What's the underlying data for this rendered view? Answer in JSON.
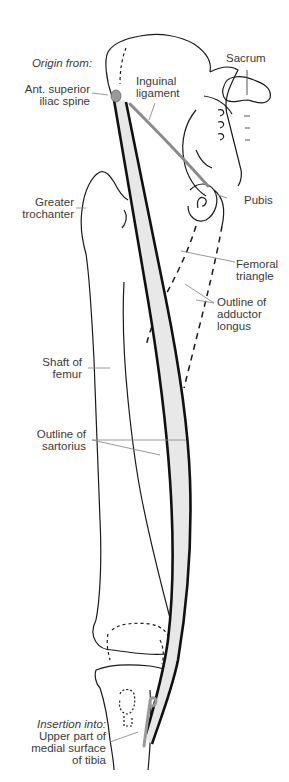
{
  "diagram": {
    "colors": {
      "muscle_fill": "#e8e8e8",
      "outline": "#1a1a1a",
      "ligament": "#8a8a8a",
      "attachment": "#9a9a9a",
      "leader": "#8c8c8c",
      "text": "#3a3a3a"
    },
    "labels": {
      "origin_heading": "Origin from:",
      "ant_superior_1": "Ant. superior",
      "ant_superior_2": "iliac spine",
      "inguinal_1": "Inguinal",
      "inguinal_2": "ligament",
      "sacrum": "Sacrum",
      "pubis": "Pubis",
      "greater_troch_1": "Greater",
      "greater_troch_2": "trochanter",
      "femoral_tri_1": "Femoral",
      "femoral_tri_2": "triangle",
      "adductor_1": "Outline of",
      "adductor_2": "adductor",
      "adductor_3": "longus",
      "shaft_1": "Shaft of",
      "shaft_2": "femur",
      "sartorius_1": "Outline of",
      "sartorius_2": "sartorius",
      "insertion_heading": "Insertion into:",
      "insertion_1": "Upper part of",
      "insertion_2": "medial surface",
      "insertion_3": "of tibia"
    }
  }
}
